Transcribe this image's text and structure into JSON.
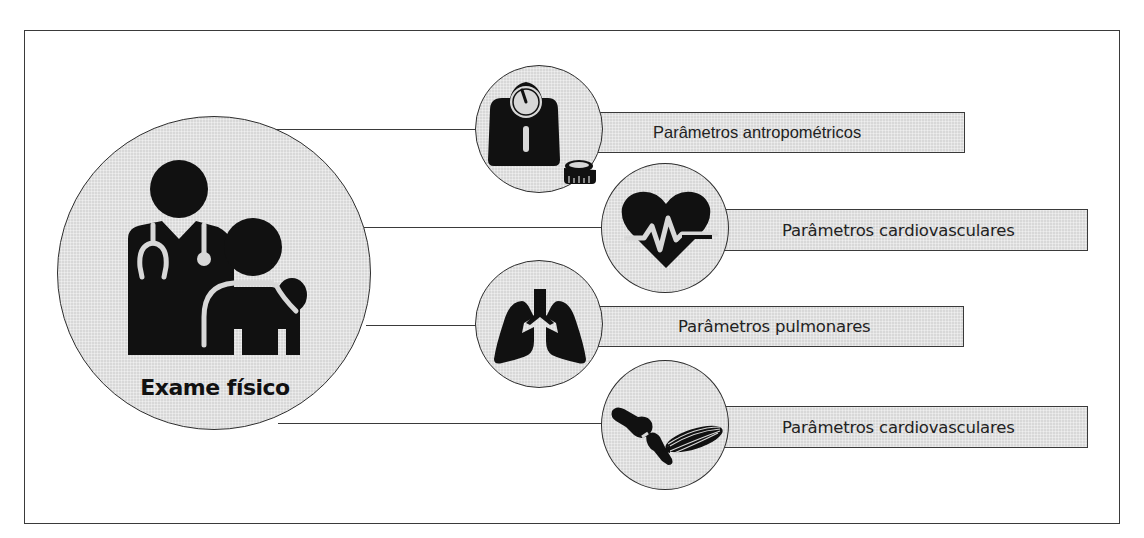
{
  "diagram": {
    "central_node": {
      "label": "Exame físico",
      "icon": "doctor-patient-icon"
    },
    "branches": [
      {
        "label": "Parâmetros antropométricos",
        "icon": "scale-and-tape-measure-icon"
      },
      {
        "label": "Parâmetros cardiovasculares",
        "icon": "heart-pulse-icon"
      },
      {
        "label": "Parâmetros pulmonares",
        "icon": "lungs-icon"
      },
      {
        "label": "Parâmetros cardiovasculares",
        "icon": "joint-and-muscle-icon"
      }
    ]
  },
  "colors": {
    "node_fill": "#d8d8d8",
    "stroke": "#3a3a3a",
    "icon": "#111111",
    "background": "#ffffff"
  }
}
